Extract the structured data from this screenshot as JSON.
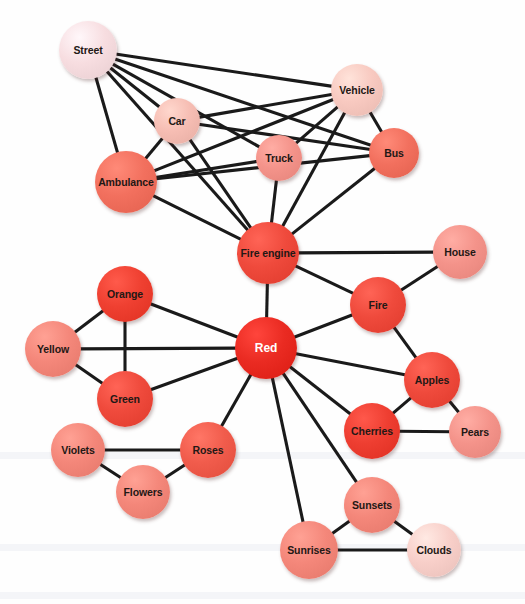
{
  "figure": {
    "type": "semantic-network-diagram",
    "title": "",
    "background_color": "#ffffff",
    "edge_color": "#1a1a1a",
    "width": 525,
    "height": 604
  },
  "palette": {
    "hub_red": "#ea2b22",
    "strong_red": "#ef4a3c",
    "medium_red": "#f2705e",
    "light_pink": "#f4a093",
    "pale_pink": "#f8c9c0",
    "palest_pink": "#f7dde0",
    "label_dark": "#231815",
    "label_light": "#ffffff"
  },
  "chart_data": {
    "type": "network",
    "nodes": [
      {
        "id": "street",
        "label": "Street",
        "x": 88,
        "y": 50,
        "r": 29,
        "color": "#f7dde0",
        "text": "#231815"
      },
      {
        "id": "vehicle",
        "label": "Vehicle",
        "x": 357,
        "y": 90,
        "r": 26,
        "color": "#f8c9c0",
        "text": "#231815"
      },
      {
        "id": "car",
        "label": "Car",
        "x": 177,
        "y": 121,
        "r": 23,
        "color": "#f6bdb3",
        "text": "#231815"
      },
      {
        "id": "bus",
        "label": "Bus",
        "x": 394,
        "y": 153,
        "r": 25,
        "color": "#f2705e",
        "text": "#231815"
      },
      {
        "id": "truck",
        "label": "Truck",
        "x": 279,
        "y": 158,
        "r": 23,
        "color": "#f4938a",
        "text": "#231815"
      },
      {
        "id": "ambulance",
        "label": "Ambulance",
        "x": 126,
        "y": 182,
        "r": 31,
        "color": "#f2705e",
        "text": "#231815"
      },
      {
        "id": "fire_engine",
        "label": "Fire engine",
        "x": 268,
        "y": 253,
        "r": 31,
        "color": "#ef4a3c",
        "text": "#231815"
      },
      {
        "id": "house",
        "label": "House",
        "x": 460,
        "y": 252,
        "r": 27,
        "color": "#f4938a",
        "text": "#231815"
      },
      {
        "id": "fire",
        "label": "Fire",
        "x": 378,
        "y": 305,
        "r": 28,
        "color": "#ef4a3c",
        "text": "#231815"
      },
      {
        "id": "orange",
        "label": "Orange",
        "x": 125,
        "y": 294,
        "r": 28,
        "color": "#ef4031",
        "text": "#231815"
      },
      {
        "id": "yellow",
        "label": "Yellow",
        "x": 53,
        "y": 349,
        "r": 28,
        "color": "#f4877a",
        "text": "#231815"
      },
      {
        "id": "green",
        "label": "Green",
        "x": 125,
        "y": 399,
        "r": 28,
        "color": "#ef4a3c",
        "text": "#231815"
      },
      {
        "id": "red",
        "label": "Red",
        "x": 266,
        "y": 348,
        "r": 31,
        "color": "#ea2b22",
        "text": "#ffffff"
      },
      {
        "id": "apples",
        "label": "Apples",
        "x": 432,
        "y": 380,
        "r": 28,
        "color": "#ef4a3c",
        "text": "#231815"
      },
      {
        "id": "cherries",
        "label": "Cherries",
        "x": 372,
        "y": 431,
        "r": 28,
        "color": "#ee3e31",
        "text": "#231815"
      },
      {
        "id": "pears",
        "label": "Pears",
        "x": 475,
        "y": 432,
        "r": 26,
        "color": "#f4938a",
        "text": "#231815"
      },
      {
        "id": "roses",
        "label": "Roses",
        "x": 208,
        "y": 450,
        "r": 28,
        "color": "#f15c4c",
        "text": "#231815"
      },
      {
        "id": "violets",
        "label": "Violets",
        "x": 78,
        "y": 450,
        "r": 27,
        "color": "#f4877a",
        "text": "#231815"
      },
      {
        "id": "flowers",
        "label": "Flowers",
        "x": 143,
        "y": 492,
        "r": 27,
        "color": "#f4877a",
        "text": "#231815"
      },
      {
        "id": "sunsets",
        "label": "Sunsets",
        "x": 372,
        "y": 505,
        "r": 28,
        "color": "#f4877a",
        "text": "#231815"
      },
      {
        "id": "sunrises",
        "label": "Sunrises",
        "x": 309,
        "y": 550,
        "r": 29,
        "color": "#f4877a",
        "text": "#231815"
      },
      {
        "id": "clouds",
        "label": "Clouds",
        "x": 434,
        "y": 550,
        "r": 27,
        "color": "#f8cfc9",
        "text": "#231815"
      }
    ],
    "edges": [
      [
        "street",
        "vehicle"
      ],
      [
        "street",
        "bus"
      ],
      [
        "street",
        "car"
      ],
      [
        "street",
        "truck"
      ],
      [
        "street",
        "fire_engine"
      ],
      [
        "street",
        "ambulance"
      ],
      [
        "vehicle",
        "car"
      ],
      [
        "vehicle",
        "truck"
      ],
      [
        "vehicle",
        "bus"
      ],
      [
        "vehicle",
        "ambulance"
      ],
      [
        "vehicle",
        "fire_engine"
      ],
      [
        "car",
        "ambulance"
      ],
      [
        "car",
        "bus"
      ],
      [
        "car",
        "fire_engine"
      ],
      [
        "truck",
        "ambulance"
      ],
      [
        "truck",
        "fire_engine"
      ],
      [
        "bus",
        "ambulance"
      ],
      [
        "bus",
        "fire_engine"
      ],
      [
        "ambulance",
        "fire_engine"
      ],
      [
        "fire_engine",
        "red"
      ],
      [
        "fire_engine",
        "house"
      ],
      [
        "fire_engine",
        "fire"
      ],
      [
        "house",
        "fire"
      ],
      [
        "fire",
        "red"
      ],
      [
        "fire",
        "apples"
      ],
      [
        "red",
        "orange"
      ],
      [
        "red",
        "yellow"
      ],
      [
        "red",
        "green"
      ],
      [
        "red",
        "apples"
      ],
      [
        "red",
        "cherries"
      ],
      [
        "red",
        "roses"
      ],
      [
        "red",
        "sunsets"
      ],
      [
        "red",
        "sunrises"
      ],
      [
        "orange",
        "yellow"
      ],
      [
        "orange",
        "green"
      ],
      [
        "yellow",
        "green"
      ],
      [
        "apples",
        "cherries"
      ],
      [
        "apples",
        "pears"
      ],
      [
        "cherries",
        "pears"
      ],
      [
        "roses",
        "violets"
      ],
      [
        "roses",
        "flowers"
      ],
      [
        "violets",
        "flowers"
      ],
      [
        "sunsets",
        "sunrises"
      ],
      [
        "sunsets",
        "clouds"
      ],
      [
        "sunrises",
        "clouds"
      ]
    ]
  }
}
